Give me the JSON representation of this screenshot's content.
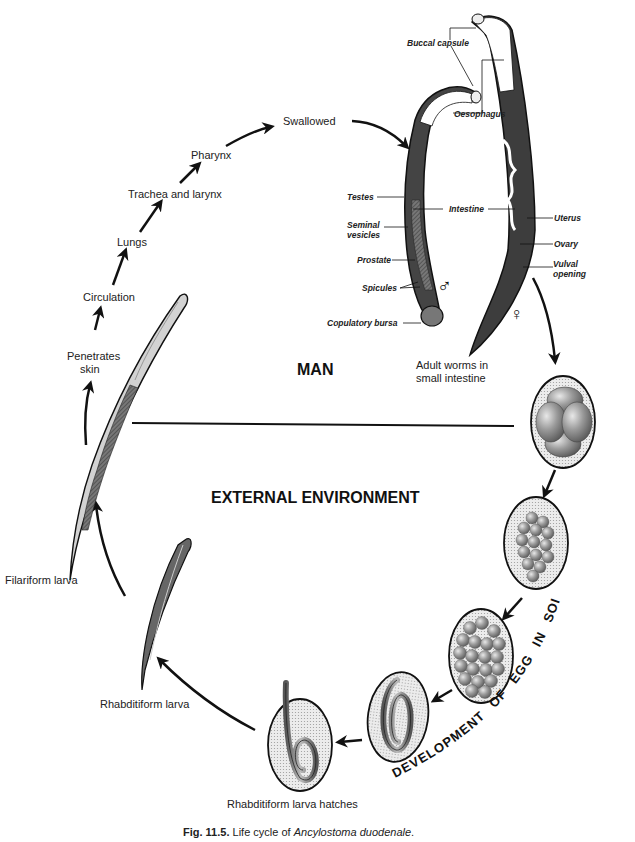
{
  "diagram": {
    "regions": {
      "host": "MAN",
      "environment": "EXTERNAL ENVIRONMENT"
    },
    "cycle_steps": [
      {
        "id": "penetrates",
        "label_lines": [
          "Penetrates",
          "skin"
        ]
      },
      {
        "id": "circulation",
        "label": "Circulation"
      },
      {
        "id": "lungs",
        "label": "Lungs"
      },
      {
        "id": "trachea",
        "label": "Trachea and larynx"
      },
      {
        "id": "pharynx",
        "label": "Pharynx"
      },
      {
        "id": "swallowed",
        "label": "Swallowed"
      }
    ],
    "adult_worms": {
      "caption_lines": [
        "Adult worms in",
        "small intestine"
      ],
      "male_symbol": "♂",
      "female_symbol": "♀",
      "labels": {
        "buccal_capsule": "Buccal capsule",
        "oesophagus": "Oesophagus",
        "testes": "Testes",
        "intestine": "Intestine",
        "uterus": "Uterus",
        "seminal_vesicles_1": "Seminal",
        "seminal_vesicles_2": "vesicles",
        "ovary": "Ovary",
        "vulval_1": "Vulval",
        "vulval_2": "opening",
        "prostate": "Prostate",
        "spicules": "Spicules",
        "copulatory_bursa": "Copulatory bursa"
      }
    },
    "soil_development": {
      "arc_label_words": [
        "DEVELOPMENT",
        "OF",
        "EGG",
        "IN",
        "SOIL"
      ]
    },
    "larval_stages": {
      "hatches": "Rhabditiform larva hatches",
      "rhabditiform": "Rhabditiform larva",
      "filariform": "Filariform larva"
    }
  },
  "caption": {
    "fig_number": "Fig. 11.5.",
    "text": " Life cycle of ",
    "species": "Ancylostoma duodenale",
    "end": "."
  },
  "colors": {
    "ink": "#1a1a1a",
    "egg_fill": "#dcdcdc",
    "cell_fill": "#8c8c8c",
    "worm_dark": "#3a3a3a",
    "worm_light": "#cfcfcf"
  }
}
